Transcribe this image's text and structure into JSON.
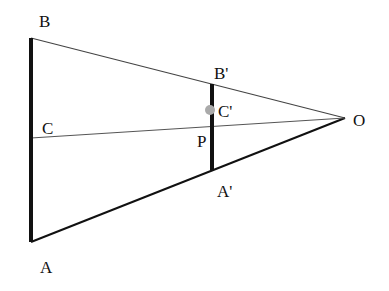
{
  "diagram": {
    "type": "geometry-similar-triangles",
    "colors": {
      "background": "#ffffff",
      "line": "#111111",
      "thin_line": "#444444",
      "point_marker": "#aaaaaa"
    },
    "points": {
      "B": {
        "label": "B",
        "x": 31,
        "y": 38
      },
      "A": {
        "label": "A",
        "x": 31,
        "y": 242
      },
      "C": {
        "label": "C",
        "x": 31,
        "y": 138
      },
      "O": {
        "label": "O",
        "x": 345,
        "y": 118
      },
      "B'": {
        "label": "B'",
        "x": 212,
        "y": 84
      },
      "A'": {
        "label": "A'",
        "x": 212,
        "y": 170
      },
      "C'": {
        "label": "C'",
        "x": 210,
        "y": 110
      },
      "P": {
        "label": "P",
        "x": 212,
        "y": 126
      }
    },
    "labels": {
      "B": "B",
      "A": "A",
      "C": "C",
      "O": "O",
      "B_prime": "B'",
      "A_prime": "A'",
      "C_prime": "C'",
      "P": "P"
    },
    "segments": [
      {
        "from": "A",
        "to": "B",
        "style": "thick"
      },
      {
        "from": "A'",
        "to": "B'",
        "style": "thick"
      },
      {
        "from": "B",
        "to": "O",
        "style": "thin"
      },
      {
        "from": "A",
        "to": "O",
        "style": "medium"
      },
      {
        "from": "C",
        "to": "O",
        "style": "thin"
      }
    ]
  }
}
